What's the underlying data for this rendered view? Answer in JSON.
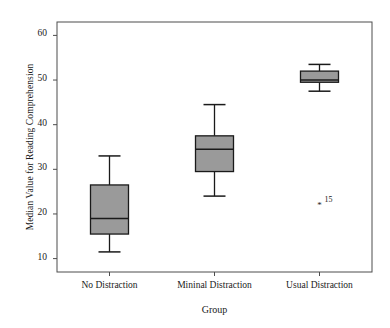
{
  "chart_data": {
    "type": "box",
    "title": "",
    "xlabel": "Group",
    "ylabel": "Median Value for Reading Comprehension",
    "ylim": [
      7,
      63
    ],
    "yticks": [
      10,
      20,
      30,
      40,
      50,
      60
    ],
    "ytick_labels": [
      "10",
      "20",
      "30",
      "40",
      "50",
      "60"
    ],
    "grid": false,
    "legend": "none",
    "categories": [
      "No Distraction",
      "Mininal Distraction",
      "Usual Distraction"
    ],
    "boxes": [
      {
        "category": "No Distraction",
        "whisker_low": 11.5,
        "q1": 15.5,
        "median": 19.0,
        "q3": 26.5,
        "whisker_high": 33.0,
        "outliers": []
      },
      {
        "category": "Mininal Distraction",
        "whisker_low": 24.0,
        "q1": 29.5,
        "median": 34.5,
        "q3": 37.5,
        "whisker_high": 44.5,
        "outliers": []
      },
      {
        "category": "Usual Distraction",
        "whisker_low": 47.5,
        "q1": 49.5,
        "median": 50.0,
        "q3": 52.0,
        "whisker_high": 53.5,
        "outliers": [
          {
            "value": 22.0,
            "label": "15"
          }
        ]
      }
    ],
    "box_fill_color": "#9a9a9a",
    "box_line_color": "#1a1a1a",
    "frame_color": "#4d4d4d"
  }
}
